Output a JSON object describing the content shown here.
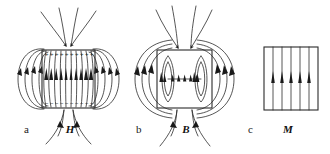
{
  "figure": {
    "background_color": "#ffffff",
    "line_color": "#2b2b2b",
    "label_color": "#1a1a1a",
    "width": 330,
    "height": 154,
    "panels": [
      {
        "id": "a",
        "panel_label": "a",
        "field_label": "H",
        "field_name": "magnetic-field-strength",
        "description": "H field lines of a uniformly magnetized bar, with positive magnetic surface charges on the top face and negative on the bottom face; interior lines point upward, exterior lines loop from top to bottom.",
        "box": {
          "x": 42,
          "y": 50,
          "width": 53,
          "height": 58
        },
        "top_charge_symbol": "+",
        "bottom_charge_symbol": "−",
        "top_charge_count": 10,
        "bottom_charge_count": 10,
        "interior_line_count": 9,
        "exterior_loop_count": 4,
        "interior_arrow_direction": "up",
        "label_x": 24,
        "label_y": 133,
        "field_label_x": 70,
        "field_label_y": 133
      },
      {
        "id": "b",
        "panel_label": "b",
        "field_label": "B",
        "field_name": "magnetic-flux-density",
        "description": "B field of the same bar drawn as continuous closed loops that pass through the material; interior arrows point upward and the loops close outside the bar.",
        "box": {
          "x": 157,
          "y": 50,
          "width": 55,
          "height": 58
        },
        "loop_count": 5,
        "interior_arrow_count": 5,
        "interior_arrow_direction": "up",
        "label_x": 136,
        "label_y": 133,
        "field_label_x": 186,
        "field_label_y": 133
      },
      {
        "id": "c",
        "panel_label": "c",
        "field_label": "M",
        "field_name": "magnetization",
        "description": "Magnetization M is uniform and exists only inside the material; straight vertical lines with upward arrows terminate at the bar surfaces and there is no external field.",
        "box": {
          "x": 264,
          "y": 47,
          "width": 54,
          "height": 63
        },
        "interior_line_count": 5,
        "interior_arrow_direction": "up",
        "label_x": 248,
        "label_y": 133,
        "field_label_x": 288,
        "field_label_y": 133
      }
    ]
  }
}
